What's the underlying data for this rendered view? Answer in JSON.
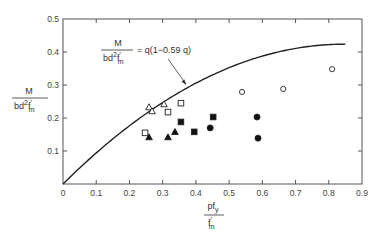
{
  "chart_data": {
    "type": "scatter",
    "title": "",
    "xlabel": {
      "numerator": "pf",
      "numerator_sub": "y",
      "denominator": "f",
      "denominator_sup": "′",
      "denominator_sub": "m"
    },
    "ylabel": {
      "numerator": "M",
      "denominator": "bd",
      "denominator_sup": "2",
      "denominator_f": "f",
      "denominator_f_sup": "′",
      "denominator_f_sub": "m"
    },
    "xlim": [
      0,
      0.9
    ],
    "ylim": [
      0,
      0.5
    ],
    "xticks": [
      0,
      0.1,
      0.2,
      0.3,
      0.4,
      0.5,
      0.6,
      0.7,
      0.8,
      0.9
    ],
    "xtick_labels": [
      "0",
      "0.1",
      "0.2",
      "0.3",
      "0.4",
      "0.5",
      "0.6",
      "0.7",
      "0.8",
      "0.9"
    ],
    "yticks": [
      0,
      0.1,
      0.2,
      0.3,
      0.4,
      0.5
    ],
    "ytick_labels": [
      "0",
      "0.1",
      "0.2",
      "0.3",
      "0.4",
      "0.5"
    ],
    "grid": false,
    "curve": {
      "name": "M/(bd²f′m) = q(1 − 0.59q)",
      "equation_lhs_num": "M",
      "equation_lhs_den": "bd",
      "equation_rhs": "= q(1−0.59 q)",
      "coefficient": 0.59,
      "q_range": [
        0,
        0.85
      ]
    },
    "annotation_arrow_target_q": 0.39,
    "series": [
      {
        "name": "open-triangle",
        "marker": "triangle",
        "filled": false,
        "points": [
          [
            0.259,
            0.233
          ],
          [
            0.268,
            0.221
          ],
          [
            0.304,
            0.242
          ]
        ]
      },
      {
        "name": "open-square",
        "marker": "square",
        "filled": false,
        "points": [
          [
            0.355,
            0.245
          ],
          [
            0.316,
            0.218
          ],
          [
            0.247,
            0.155
          ]
        ]
      },
      {
        "name": "filled-triangle",
        "marker": "triangle",
        "filled": true,
        "points": [
          [
            0.259,
            0.142
          ],
          [
            0.316,
            0.142
          ],
          [
            0.337,
            0.158
          ]
        ]
      },
      {
        "name": "filled-square",
        "marker": "square",
        "filled": true,
        "points": [
          [
            0.355,
            0.188
          ],
          [
            0.395,
            0.158
          ],
          [
            0.452,
            0.203
          ]
        ]
      },
      {
        "name": "filled-circle",
        "marker": "circle",
        "filled": true,
        "points": [
          [
            0.443,
            0.17
          ],
          [
            0.584,
            0.203
          ],
          [
            0.587,
            0.139
          ]
        ]
      },
      {
        "name": "open-circle",
        "marker": "circle",
        "filled": false,
        "points": [
          [
            0.539,
            0.279
          ],
          [
            0.663,
            0.288
          ],
          [
            0.81,
            0.348
          ]
        ]
      }
    ]
  }
}
